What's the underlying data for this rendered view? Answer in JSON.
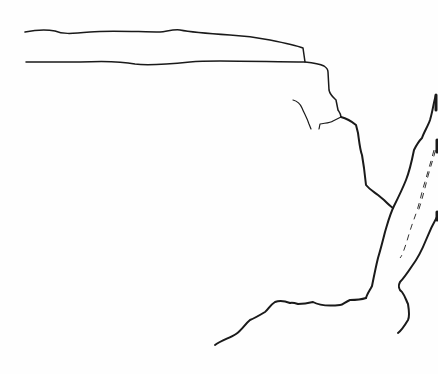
{
  "map": {
    "type": "line-sketch",
    "background": "#fefefe",
    "stroke_color": "#1a1a1a",
    "features": [
      {
        "name": "upper-boundary-line"
      },
      {
        "name": "lower-boundary-line"
      },
      {
        "name": "vertical-boundary-line"
      },
      {
        "name": "short-branch-line"
      },
      {
        "name": "river-left-bank"
      },
      {
        "name": "river-right-bank"
      },
      {
        "name": "river-dashed-channel"
      },
      {
        "name": "bottom-boundary-line"
      }
    ]
  }
}
